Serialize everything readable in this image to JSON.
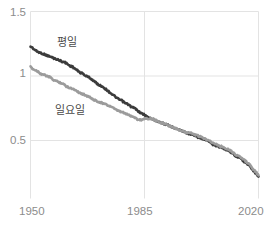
{
  "chart_data": {
    "type": "line",
    "title": "",
    "subtitle": "",
    "xlabel": "",
    "ylabel": "",
    "xlim": [
      1950,
      2020
    ],
    "ylim": [
      0.15,
      1.5
    ],
    "grid": true,
    "legend_position": "inline-annotation",
    "x_ticks": [
      "1950",
      "1985",
      "2020"
    ],
    "x_tick_values": [
      1950,
      1985,
      2020
    ],
    "y_ticks": [
      "0.5",
      "1",
      "1.5"
    ],
    "y_tick_values": [
      0.5,
      1,
      1.5
    ],
    "colors": {
      "weekday": "#3b3b3b",
      "sunday": "#9b9b9b",
      "grid": "#e3e3e3",
      "tick_text": "#8c8c8c",
      "label_text": "#4a4a4a",
      "background": "#ffffff"
    },
    "series": [
      {
        "name": "평일",
        "color": "#3b3b3b",
        "x": [
          1950,
          1951,
          1952,
          1953,
          1954,
          1955,
          1956,
          1957,
          1958,
          1959,
          1960,
          1961,
          1962,
          1963,
          1964,
          1965,
          1966,
          1967,
          1968,
          1969,
          1970,
          1971,
          1972,
          1973,
          1974,
          1975,
          1976,
          1977,
          1978,
          1979,
          1980,
          1981,
          1982,
          1983,
          1984,
          1985,
          1986,
          1987,
          1988,
          1989,
          1990,
          1991,
          1992,
          1993,
          1994,
          1995,
          1996,
          1997,
          1998,
          1999,
          2000,
          2001,
          2002,
          2003,
          2004,
          2005,
          2006,
          2007,
          2008,
          2009,
          2010,
          2011,
          2012,
          2013,
          2014,
          2015,
          2016,
          2017,
          2018,
          2019,
          2020
        ],
        "values": [
          1.23,
          1.21,
          1.19,
          1.18,
          1.17,
          1.16,
          1.15,
          1.14,
          1.13,
          1.12,
          1.11,
          1.1,
          1.08,
          1.07,
          1.05,
          1.03,
          1.02,
          1.0,
          0.99,
          0.97,
          0.95,
          0.93,
          0.92,
          0.9,
          0.88,
          0.86,
          0.84,
          0.82,
          0.81,
          0.79,
          0.78,
          0.76,
          0.75,
          0.73,
          0.71,
          0.7,
          0.68,
          0.67,
          0.66,
          0.65,
          0.64,
          0.63,
          0.62,
          0.61,
          0.6,
          0.59,
          0.58,
          0.57,
          0.56,
          0.55,
          0.54,
          0.53,
          0.52,
          0.51,
          0.5,
          0.49,
          0.47,
          0.46,
          0.45,
          0.44,
          0.43,
          0.42,
          0.4,
          0.38,
          0.37,
          0.35,
          0.33,
          0.31,
          0.28,
          0.25,
          0.22
        ]
      },
      {
        "name": "일요일",
        "color": "#9b9b9b",
        "x": [
          1950,
          1951,
          1952,
          1953,
          1954,
          1955,
          1956,
          1957,
          1958,
          1959,
          1960,
          1961,
          1962,
          1963,
          1964,
          1965,
          1966,
          1967,
          1968,
          1969,
          1970,
          1971,
          1972,
          1973,
          1974,
          1975,
          1976,
          1977,
          1978,
          1979,
          1980,
          1981,
          1982,
          1983,
          1984,
          1985,
          1986,
          1987,
          1988,
          1989,
          1990,
          1991,
          1992,
          1993,
          1994,
          1995,
          1996,
          1997,
          1998,
          1999,
          2000,
          2001,
          2002,
          2003,
          2004,
          2005,
          2006,
          2007,
          2008,
          2009,
          2010,
          2011,
          2012,
          2013,
          2014,
          2015,
          2016,
          2017,
          2018,
          2019,
          2020
        ],
        "values": [
          1.07,
          1.05,
          1.04,
          1.02,
          1.01,
          1.0,
          0.99,
          0.97,
          0.96,
          0.95,
          0.94,
          0.92,
          0.91,
          0.9,
          0.89,
          0.87,
          0.86,
          0.85,
          0.84,
          0.82,
          0.81,
          0.8,
          0.79,
          0.78,
          0.77,
          0.76,
          0.74,
          0.73,
          0.72,
          0.71,
          0.7,
          0.69,
          0.68,
          0.66,
          0.66,
          0.67,
          0.67,
          0.67,
          0.66,
          0.65,
          0.64,
          0.63,
          0.62,
          0.61,
          0.6,
          0.59,
          0.58,
          0.57,
          0.56,
          0.56,
          0.55,
          0.54,
          0.53,
          0.52,
          0.51,
          0.5,
          0.48,
          0.47,
          0.46,
          0.45,
          0.44,
          0.43,
          0.41,
          0.39,
          0.38,
          0.36,
          0.34,
          0.32,
          0.29,
          0.26,
          0.23
        ]
      }
    ],
    "annotations": [
      {
        "text": "평일",
        "x": 1957,
        "y": 1.24
      },
      {
        "text": "일요일",
        "x": 1956,
        "y": 0.8
      }
    ]
  },
  "axes": {
    "y_ticks": [
      {
        "label": "1.5",
        "value": 1.5
      },
      {
        "label": "1",
        "value": 1
      },
      {
        "label": "0.5",
        "value": 0.5
      }
    ],
    "x_ticks": [
      {
        "label": "1950",
        "value": 1950
      },
      {
        "label": "1985",
        "value": 1985
      },
      {
        "label": "2020",
        "value": 2020
      }
    ]
  },
  "labels": {
    "weekday": "평일",
    "sunday": "일요일"
  }
}
